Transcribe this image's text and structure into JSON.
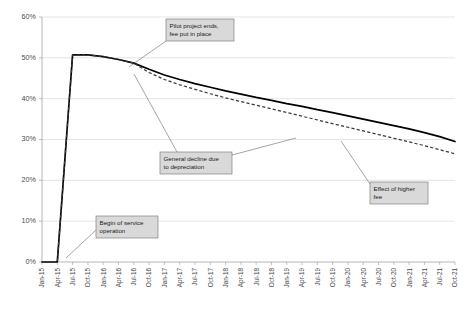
{
  "chart_data": {
    "type": "line",
    "title": "",
    "xlabel": "",
    "ylabel": "",
    "ylim": [
      0,
      0.6
    ],
    "ytick_labels": [
      "0%",
      "10%",
      "20%",
      "30%",
      "40%",
      "50%",
      "60%"
    ],
    "ytick_values": [
      0,
      0.1,
      0.2,
      0.3,
      0.4,
      0.5,
      0.6
    ],
    "grid": true,
    "legend": "none",
    "categories": [
      "Jan-15",
      "Apr-15",
      "Jul-15",
      "Oct-15",
      "Jan-16",
      "Apr-16",
      "Jul-16",
      "Oct-16",
      "Jan-17",
      "Apr-17",
      "Jul-17",
      "Oct-17",
      "Jan-18",
      "Apr-18",
      "Jul-18",
      "Oct-18",
      "Jan-19",
      "Apr-19",
      "Jul-19",
      "Oct-19",
      "Jan-20",
      "Apr-20",
      "Jul-20",
      "Oct-20",
      "Jan-21",
      "Apr-21",
      "Jul-21",
      "Oct-21"
    ],
    "series": [
      {
        "name": "With higher fee",
        "style": "solid",
        "color": "#000000",
        "values": [
          0.0,
          0.0,
          0.507,
          0.507,
          0.503,
          0.496,
          0.487,
          0.472,
          0.458,
          0.447,
          0.437,
          0.428,
          0.419,
          0.411,
          0.403,
          0.396,
          0.388,
          0.381,
          0.373,
          0.366,
          0.358,
          0.35,
          0.342,
          0.334,
          0.326,
          0.317,
          0.307,
          0.295
        ]
      },
      {
        "name": "Without higher fee",
        "style": "dashed",
        "color": "#3a3a3a",
        "values": [
          0.0,
          0.0,
          0.507,
          0.507,
          0.503,
          0.496,
          0.487,
          0.464,
          0.447,
          0.434,
          0.423,
          0.412,
          0.402,
          0.393,
          0.384,
          0.375,
          0.366,
          0.357,
          0.348,
          0.339,
          0.33,
          0.321,
          0.312,
          0.303,
          0.294,
          0.285,
          0.275,
          0.265
        ]
      }
    ],
    "annotations": [
      {
        "id": "pilot-project-ends",
        "lines": [
          "Pilot project ends,",
          "fee put in place"
        ],
        "box": {
          "x": 166,
          "y": 19,
          "w": 68,
          "h": 22
        },
        "leader_from": {
          "x": 166,
          "y": 41
        },
        "leader_to": {
          "x": 129,
          "y": 67
        }
      },
      {
        "id": "general-decline",
        "lines": [
          "General decline due",
          "to depreciation"
        ],
        "box": {
          "x": 160,
          "y": 152,
          "w": 72,
          "h": 22
        },
        "leader_from": {
          "x": 177,
          "y": 152
        },
        "leader_to": {
          "x": 134,
          "y": 74
        }
      },
      {
        "id": "effect-of-higher-fee",
        "lines": [
          "Effect of higher",
          "fee"
        ],
        "box": {
          "x": 370,
          "y": 182,
          "w": 58,
          "h": 22
        },
        "leader_from": {
          "x": 370,
          "y": 184
        },
        "leader_to": {
          "x": 341,
          "y": 141
        }
      },
      {
        "id": "begin-of-service-operation",
        "lines": [
          "Begin of service",
          "operation"
        ],
        "box": {
          "x": 96,
          "y": 216,
          "w": 62,
          "h": 22
        },
        "leader_from": {
          "x": 96,
          "y": 230
        },
        "leader_to": {
          "x": 66,
          "y": 258
        }
      }
    ],
    "extra_leaders": [
      {
        "id": "general-decline-second",
        "from": {
          "x": 232,
          "y": 155
        },
        "to": {
          "x": 296,
          "y": 138
        }
      }
    ]
  }
}
